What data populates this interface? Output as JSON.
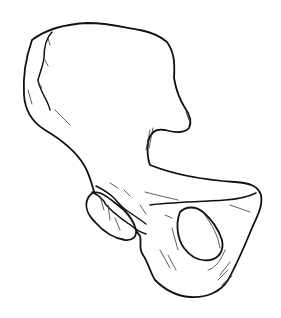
{
  "image": {
    "subject": "hip bone line drawing",
    "style": "black ink outline on white background",
    "colors": {
      "background": "#ffffff",
      "ink": "#111111"
    },
    "parts": [
      {
        "id": "ilium",
        "label": "Ilium (wing)"
      },
      {
        "id": "acetabulum",
        "label": "Acetabulum rim"
      },
      {
        "id": "pubis",
        "label": "Pubis"
      },
      {
        "id": "ischium",
        "label": "Ischium"
      },
      {
        "id": "obturator-foramen",
        "label": "Obturator foramen"
      }
    ]
  }
}
